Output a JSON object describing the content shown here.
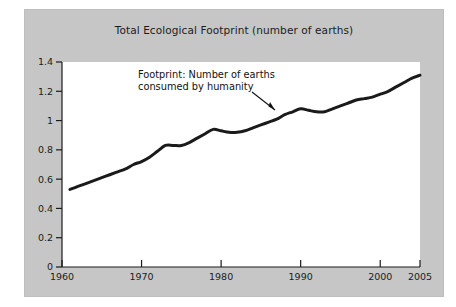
{
  "figure": {
    "panel_color": "#c6c6c6",
    "plot_bg_color": "#ffffff",
    "line_color": "#1a1a1a",
    "text_color": "#1b1b1b"
  },
  "annotation": {
    "line1": "Footprint: Number of earths",
    "line2": "consumed by humanity",
    "arrow_name": "annotation-arrow"
  },
  "chart_data": {
    "type": "line",
    "title": "Total Ecological Footprint (number of earths)",
    "xlabel": "",
    "ylabel": "",
    "xlim": [
      1960,
      2005
    ],
    "ylim": [
      0,
      1.4
    ],
    "grid": false,
    "legend": "none",
    "xticks": [
      1960,
      1970,
      1980,
      1990,
      2000,
      2005
    ],
    "xtick_labels": [
      "1960",
      "1970",
      "1980",
      "1990",
      "2000",
      "2005"
    ],
    "yticks": [
      0,
      0.2,
      0.4,
      0.6,
      0.8,
      1,
      1.2,
      1.4
    ],
    "ytick_labels": [
      "0",
      "0.2",
      "0.4",
      "0.6",
      "0.8",
      "1",
      "1.2",
      "1.4"
    ],
    "series": [
      {
        "name": "Total Ecological Footprint (number of earths)",
        "x": [
          1961,
          1962,
          1963,
          1964,
          1965,
          1966,
          1967,
          1968,
          1969,
          1970,
          1971,
          1972,
          1973,
          1974,
          1975,
          1976,
          1977,
          1978,
          1979,
          1980,
          1981,
          1982,
          1983,
          1984,
          1985,
          1986,
          1987,
          1988,
          1989,
          1990,
          1991,
          1992,
          1993,
          1994,
          1995,
          1996,
          1997,
          1998,
          1999,
          2000,
          2001,
          2002,
          2003,
          2004,
          2005
        ],
        "values": [
          0.53,
          0.55,
          0.57,
          0.59,
          0.61,
          0.63,
          0.65,
          0.67,
          0.7,
          0.72,
          0.75,
          0.79,
          0.83,
          0.83,
          0.83,
          0.85,
          0.88,
          0.91,
          0.94,
          0.93,
          0.92,
          0.92,
          0.93,
          0.95,
          0.97,
          0.99,
          1.01,
          1.04,
          1.06,
          1.08,
          1.07,
          1.06,
          1.06,
          1.08,
          1.1,
          1.12,
          1.14,
          1.15,
          1.16,
          1.18,
          1.2,
          1.23,
          1.26,
          1.29,
          1.31
        ]
      }
    ]
  }
}
